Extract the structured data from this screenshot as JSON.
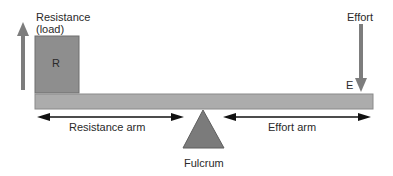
{
  "diagram": {
    "labels": {
      "resistance": "Resistance",
      "load": "(load)",
      "resistance_box": "R",
      "effort": "Effort",
      "effort_point": "E",
      "resistance_arm": "Resistance arm",
      "effort_arm": "Effort arm",
      "fulcrum": "Fulcrum"
    },
    "colors": {
      "beam": "#a8a8a8",
      "load_box": "#8c8c8c",
      "fulcrum": "#7a7a7a",
      "arrows": "#777777",
      "dim_arrows": "#111111"
    }
  }
}
